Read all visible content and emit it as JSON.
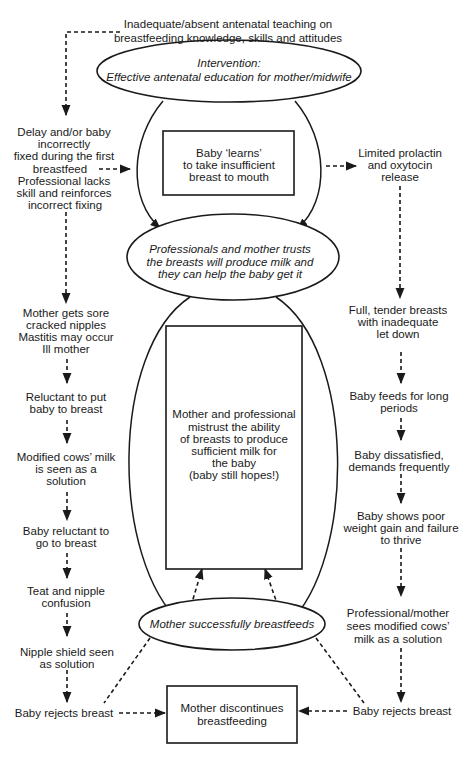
{
  "diagram": {
    "colors": {
      "ink": "#1a1a1a",
      "background": "#ffffff"
    },
    "top_cause": {
      "lines": [
        "Inadequate/absent antenatal teaching on",
        "breastfeeding knowledge, skills and attitudes"
      ]
    },
    "ellipses": {
      "intervention": {
        "lines": [
          "Intervention:",
          "Effective antenatal education for mother/midwife"
        ]
      },
      "trust": {
        "lines": [
          "Professionals and mother trusts",
          "the breasts will produce milk and",
          "they can help the baby get it"
        ]
      },
      "success": {
        "lines": [
          "Mother successfully breastfeeds"
        ]
      }
    },
    "boxes": {
      "learns": {
        "lines": [
          "Baby ‘learns’",
          "to take insufficient",
          "breast to mouth"
        ]
      },
      "mistrust": {
        "lines": [
          "Mother and professional",
          "mistrust the ability",
          "of breasts to produce",
          "sufficient milk for",
          "the baby",
          "(baby still hopes!)"
        ]
      },
      "discontinue": {
        "lines": [
          "Mother discontinues",
          "breastfeeding"
        ]
      }
    },
    "left_chain": [
      {
        "lines": [
          "Delay and/or baby",
          "incorrectly",
          "fixed during the first",
          "breastfeed",
          "Professional lacks",
          "skill and reinforces",
          "incorrect fixing"
        ]
      },
      {
        "lines": [
          "Mother gets sore",
          "cracked nipples",
          "Mastitis may occur",
          "Ill mother"
        ]
      },
      {
        "lines": [
          "Reluctant to put",
          "baby to breast"
        ]
      },
      {
        "lines": [
          "Modified cows’ milk",
          "is seen as a",
          "solution"
        ]
      },
      {
        "lines": [
          "Baby reluctant to",
          "go to breast"
        ]
      },
      {
        "lines": [
          "Teat and nipple",
          "confusion"
        ]
      },
      {
        "lines": [
          "Nipple shield seen",
          "as solution"
        ]
      },
      {
        "lines": [
          "Baby rejects breast"
        ]
      }
    ],
    "right_chain": [
      {
        "lines": [
          "Limited prolactin",
          "and oxytocin",
          "release"
        ]
      },
      {
        "lines": [
          "Full, tender breasts",
          "with inadequate",
          "let down"
        ]
      },
      {
        "lines": [
          "Baby feeds for long",
          "periods"
        ]
      },
      {
        "lines": [
          "Baby dissatisfied,",
          "demands frequently"
        ]
      },
      {
        "lines": [
          "Baby shows poor",
          "weight gain and failure",
          "to thrive"
        ]
      },
      {
        "lines": [
          "Professional/mother",
          "sees modified cows’",
          "milk as a solution"
        ]
      },
      {
        "lines": [
          "Baby rejects breast"
        ]
      }
    ]
  }
}
